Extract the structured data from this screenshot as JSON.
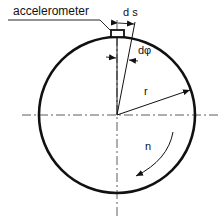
{
  "diagram": {
    "labels": {
      "sensor": "accelerometer",
      "arc_length": "d s",
      "angle": "dφ",
      "radius": "r",
      "rotation": "n"
    },
    "colors": {
      "stroke": "#111111",
      "background": "#ffffff"
    }
  }
}
